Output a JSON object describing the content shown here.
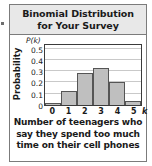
{
  "figure": {
    "title_lines": [
      "Binomial Distribution",
      "for Your Survey"
    ],
    "caption_lines": [
      "Number of teenagers who",
      "say they spend too much",
      "time on their cell phones"
    ],
    "colors": {
      "bar_fill": "#bfbfbf",
      "bar_border": "#555555",
      "title_bar_background": "#e8e8e8",
      "frame_border": "#7b7b7b",
      "axis": "#3b3b3b",
      "gridline": "#c9c9c9",
      "text": "#1a1a1a"
    }
  },
  "chart_data": {
    "type": "bar",
    "title": "Binomial Distribution for Your Survey",
    "subtitle": "",
    "xlabel": "k",
    "ylabel": "Probability",
    "y_axis_symbol": "P(k)",
    "caption": "Number of teenagers who say they spend too much time on their cell phones",
    "categories": [
      "0",
      "1",
      "2",
      "3",
      "4",
      "5"
    ],
    "values": [
      0.02,
      0.12,
      0.28,
      0.33,
      0.2,
      0.04
    ],
    "xlim": [
      -0.5,
      5.5
    ],
    "ylim": [
      0,
      0.55
    ],
    "ytick_labels": [
      "0",
      "0.1",
      "0.2",
      "0.3",
      "0.4",
      "0.5"
    ],
    "ytick_values": [
      0,
      0.1,
      0.2,
      0.3,
      0.4,
      0.5
    ],
    "xtick_labels": [
      "0",
      "1",
      "2",
      "3",
      "4",
      "5"
    ],
    "grid": "horizontal",
    "legend": "none"
  }
}
